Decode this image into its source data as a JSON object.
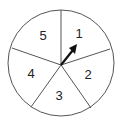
{
  "spinner": {
    "sections": [
      {
        "label": "1",
        "x": 79,
        "y": 38
      },
      {
        "label": "2",
        "x": 88,
        "y": 79
      },
      {
        "label": "3",
        "x": 59,
        "y": 99
      },
      {
        "label": "4",
        "x": 31,
        "y": 78
      },
      {
        "label": "5",
        "x": 43,
        "y": 40
      }
    ],
    "stroke_color": "#444444",
    "arrow_color": "#111111"
  }
}
